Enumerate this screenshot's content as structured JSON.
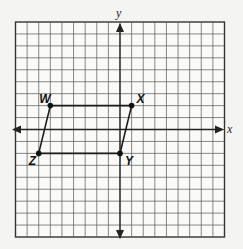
{
  "figure": {
    "type": "coordinate-plane",
    "grid": {
      "x_min": -9,
      "x_max": 9,
      "y_min": -9,
      "y_max": 9,
      "step": 1
    },
    "axes": {
      "x_label": "x",
      "y_label": "y"
    },
    "shape": {
      "name": "parallelogram WXYZ",
      "vertices": [
        {
          "label": "W",
          "x": -6,
          "y": 2
        },
        {
          "label": "X",
          "x": 1,
          "y": 2
        },
        {
          "label": "Y",
          "x": 0,
          "y": -2
        },
        {
          "label": "Z",
          "x": -7,
          "y": -2
        }
      ],
      "edges": [
        [
          "W",
          "X"
        ],
        [
          "X",
          "Y"
        ],
        [
          "Y",
          "Z"
        ],
        [
          "Z",
          "W"
        ]
      ]
    }
  }
}
